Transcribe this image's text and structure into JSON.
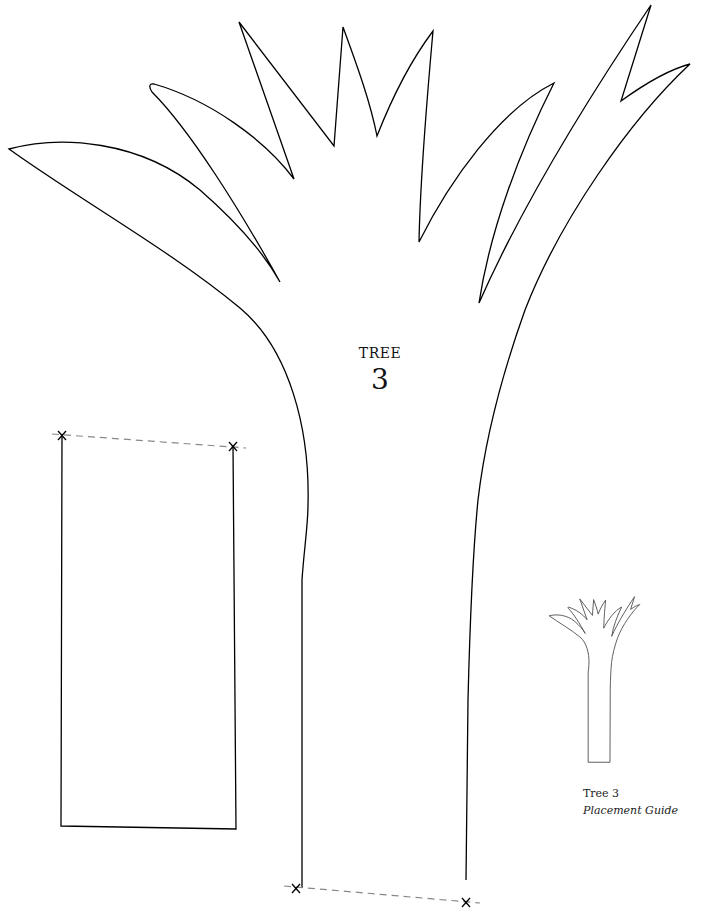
{
  "title": {
    "word": "TREE",
    "number": "3"
  },
  "placement_guide": {
    "line1": "Tree 3",
    "line2": "Placement Guide"
  },
  "colors": {
    "outline": "#000000",
    "dash": "#888888",
    "background": "#ffffff"
  }
}
